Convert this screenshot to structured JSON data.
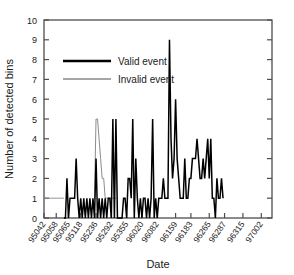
{
  "chart_data": {
    "type": "line",
    "title": "",
    "xlabel": "Date",
    "ylabel": "Number of detected bins",
    "ylim": [
      0,
      10
    ],
    "yticks": [
      0,
      1,
      2,
      3,
      4,
      5,
      6,
      7,
      8,
      9,
      10
    ],
    "grid": false,
    "legend_position": "upper-left-inside",
    "legend": [
      {
        "name": "Valid event",
        "color": "#000000",
        "linewidth": "thick"
      },
      {
        "name": "Invalid event",
        "color": "#808080",
        "linewidth": "thin"
      }
    ],
    "xtick_labels": [
      "95042",
      "95058",
      "95065",
      "95118",
      "95236",
      "95292",
      "95355",
      "96020",
      "96082",
      "96159",
      "96183",
      "96265",
      "96287",
      "96315",
      "97002"
    ],
    "xtick_index": [
      0,
      8,
      16,
      24,
      34,
      44,
      54,
      64,
      74,
      86,
      96,
      108,
      118,
      130,
      142
    ],
    "n_points": 150,
    "series": [
      {
        "name": "Valid event",
        "color": "#000000",
        "start_index": 13,
        "values": [
          0,
          0,
          2,
          0,
          1,
          1,
          1,
          1,
          3,
          1,
          0,
          1,
          0,
          1,
          0,
          1,
          0,
          1,
          0,
          1,
          0,
          3,
          0,
          1,
          0,
          1,
          0,
          1,
          0,
          1,
          1,
          0,
          5,
          0,
          5,
          0,
          0,
          0,
          0,
          1,
          1,
          0,
          2,
          2,
          1,
          5,
          0,
          3,
          1,
          0,
          1,
          0,
          1,
          1,
          0,
          1,
          0,
          1,
          5,
          0,
          1,
          0,
          1,
          1,
          1,
          2,
          1,
          1,
          1,
          9,
          4,
          2,
          3,
          6,
          3,
          2,
          1,
          1,
          1,
          3,
          1,
          1,
          2,
          2,
          3,
          3,
          3,
          4,
          3,
          2,
          2,
          3,
          2,
          3,
          4,
          2,
          4,
          1,
          1,
          0,
          2,
          1,
          1,
          2,
          1
        ]
      },
      {
        "name": "Invalid event",
        "color": "#808080",
        "start_index": 0,
        "values": [
          1,
          1,
          1,
          1,
          1,
          1,
          1,
          1,
          1,
          1,
          1,
          1,
          1,
          1
        ],
        "excursion": {
          "start_index": 33,
          "values": [
            1,
            5,
            5,
            4,
            3,
            2,
            2,
            1,
            1,
            1,
            1,
            1,
            1,
            1,
            1
          ]
        }
      }
    ]
  },
  "axis": {
    "y_tick_labels": [
      "0",
      "1",
      "2",
      "3",
      "4",
      "5",
      "6",
      "7",
      "8",
      "9",
      "10"
    ]
  }
}
